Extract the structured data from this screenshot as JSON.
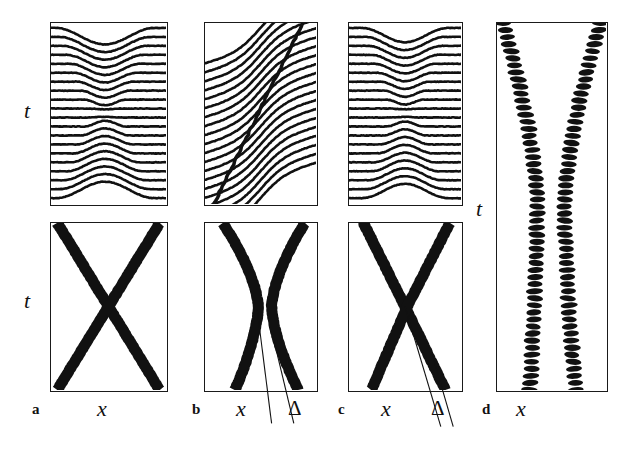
{
  "figure": {
    "kind": "scientific-multipanel-figure",
    "background": "#ffffff",
    "ink_color": "#111111",
    "width": 640,
    "height": 450
  },
  "axes": {
    "time_label": "t",
    "space_label": "x",
    "offset_label": "Δ"
  },
  "panels": [
    {
      "id": "a",
      "letter": "a",
      "letter_pos": {
        "x": 32,
        "y": 402
      },
      "has_top": true,
      "has_bottom": true,
      "top": {
        "name": "panel-a-field",
        "x": 50,
        "y": 22,
        "w": 118,
        "h": 184,
        "type": "contour-lines",
        "line_count": 20,
        "pattern": "symmetric-chevron",
        "apex_x_frac": 0.47,
        "chevron_amp": 0.46,
        "chevron_half_width": 0.4,
        "line_thickness": 2.6,
        "tilt": 0.0
      },
      "bottom": {
        "name": "panel-a-trajectories",
        "x": 50,
        "y": 222,
        "w": 118,
        "h": 170,
        "type": "trajectories",
        "style": "solid",
        "crossing": true,
        "band_width": 11,
        "tracks": [
          {
            "name": "kink",
            "x_top_frac": 0.055,
            "x_mid_frac": 0.5,
            "x_bot_frac": 0.945,
            "bend": 0.0
          },
          {
            "name": "antikink",
            "x_top_frac": 0.945,
            "x_mid_frac": 0.5,
            "x_bot_frac": 0.055,
            "bend": 0.0
          }
        ],
        "guides": []
      },
      "x_label_pos": {
        "x": 97,
        "y": 398
      },
      "t_label_top_pos": {
        "x": 24,
        "y": 100
      },
      "t_label_bottom_pos": {
        "x": 24,
        "y": 290
      },
      "delta_label_pos": null
    },
    {
      "id": "b",
      "letter": "b",
      "letter_pos": {
        "x": 192,
        "y": 402
      },
      "has_top": true,
      "has_bottom": true,
      "top": {
        "name": "panel-b-field",
        "x": 204,
        "y": 22,
        "w": 114,
        "h": 184,
        "type": "contour-lines",
        "line_count": 20,
        "pattern": "tilted-step",
        "apex_x_frac": 0.5,
        "chevron_amp": 0.42,
        "chevron_half_width": 0.42,
        "line_thickness": 2.6,
        "tilt": 1.0,
        "has_diagonal_edge": true,
        "diagonal": {
          "x_bottom_frac": 0.08,
          "x_top_frac": 0.88,
          "thickness": 2.6
        }
      },
      "bottom": {
        "name": "panel-b-trajectories",
        "x": 204,
        "y": 222,
        "w": 114,
        "h": 170,
        "type": "trajectories",
        "style": "solid",
        "crossing": false,
        "band_width": 11,
        "tracks": [
          {
            "name": "kink",
            "x_top_frac": 0.16,
            "x_mid_frac": 0.48,
            "x_bot_frac": 0.27,
            "bend": 1.0
          },
          {
            "name": "antikink",
            "x_top_frac": 0.9,
            "x_mid_frac": 0.6,
            "x_bot_frac": 0.84,
            "bend": 1.0
          }
        ],
        "guides": [
          {
            "name": "guide-x",
            "x1_frac": 0.47,
            "y1_frac": 0.52,
            "x2_frac": 0.6,
            "y2_frac": 1.2
          },
          {
            "name": "guide-delta",
            "x1_frac": 0.62,
            "y1_frac": 0.7,
            "x2_frac": 0.8,
            "y2_frac": 1.2
          }
        ]
      },
      "x_label_pos": {
        "x": 236,
        "y": 398
      },
      "t_label_top_pos": null,
      "t_label_bottom_pos": null,
      "delta_label_pos": {
        "x": 288,
        "y": 398
      }
    },
    {
      "id": "c",
      "letter": "c",
      "letter_pos": {
        "x": 338,
        "y": 402
      },
      "has_top": true,
      "has_bottom": true,
      "top": {
        "name": "panel-c-field",
        "x": 348,
        "y": 22,
        "w": 115,
        "h": 184,
        "type": "contour-lines",
        "line_count": 20,
        "pattern": "symmetric-chevron",
        "apex_x_frac": 0.5,
        "chevron_amp": 0.4,
        "chevron_half_width": 0.36,
        "line_thickness": 2.6,
        "tilt": 0.0
      },
      "bottom": {
        "name": "panel-c-trajectories",
        "x": 348,
        "y": 222,
        "w": 115,
        "h": 170,
        "type": "trajectories",
        "style": "solid",
        "crossing": true,
        "band_width": 11,
        "tracks": [
          {
            "name": "kink",
            "x_top_frac": 0.13,
            "x_mid_frac": 0.5,
            "x_bot_frac": 0.86,
            "bend": 0.35
          },
          {
            "name": "antikink",
            "x_top_frac": 0.9,
            "x_mid_frac": 0.52,
            "x_bot_frac": 0.2,
            "bend": 0.35
          }
        ],
        "guides": [
          {
            "name": "guide-x",
            "x1_frac": 0.5,
            "y1_frac": 0.5,
            "x2_frac": 0.82,
            "y2_frac": 1.22
          },
          {
            "name": "guide-delta",
            "x1_frac": 0.74,
            "y1_frac": 0.78,
            "x2_frac": 0.93,
            "y2_frac": 1.22
          }
        ]
      },
      "x_label_pos": {
        "x": 381,
        "y": 398
      },
      "t_label_top_pos": null,
      "t_label_bottom_pos": null,
      "delta_label_pos": {
        "x": 431,
        "y": 398
      }
    },
    {
      "id": "d",
      "letter": "d",
      "letter_pos": {
        "x": 482,
        "y": 402
      },
      "has_top": false,
      "has_bottom": true,
      "top": null,
      "bottom": {
        "name": "panel-d-trajectories",
        "x": 496,
        "y": 22,
        "w": 112,
        "h": 370,
        "type": "trajectories",
        "style": "dotted",
        "crossing": false,
        "band_width": 13,
        "dot_pitch": 7.0,
        "dot_rx": 8.0,
        "dot_ry": 3.0,
        "tracks": [
          {
            "name": "kink",
            "x_top_frac": 0.055,
            "x_mid_frac": 0.37,
            "x_bot_frac": 0.3,
            "bend": 1.0
          },
          {
            "name": "antikink",
            "x_top_frac": 0.95,
            "x_mid_frac": 0.62,
            "x_bot_frac": 0.72,
            "bend": 1.0
          }
        ],
        "guides": []
      },
      "x_label_pos": {
        "x": 516,
        "y": 398
      },
      "t_label_pos": {
        "x": 476,
        "y": 198
      },
      "delta_label_pos": null
    }
  ]
}
